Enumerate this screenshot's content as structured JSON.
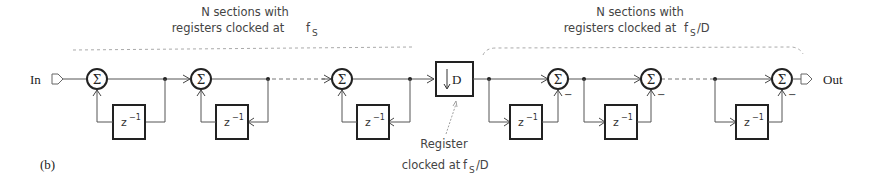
{
  "figure": {
    "panel_label": "(b)",
    "input_label": "In",
    "output_label": "Out",
    "sum_symbol": "Σ",
    "delay_label": "z",
    "delay_exp": "−1",
    "downsample_label": "D",
    "minus_sign": "−"
  },
  "integrator_group": {
    "line1": "N sections with",
    "line2": "registers clocked at",
    "freq": "f",
    "freq_sub": "S"
  },
  "comb_group": {
    "line1": "N sections with",
    "line2": "registers clocked at",
    "freq": "f",
    "freq_sub": "S",
    "freq_suffix": "/D"
  },
  "register_note": {
    "line1": "Register",
    "line2": "clocked at",
    "freq": "f",
    "freq_sub": "S",
    "freq_suffix": "/D"
  }
}
